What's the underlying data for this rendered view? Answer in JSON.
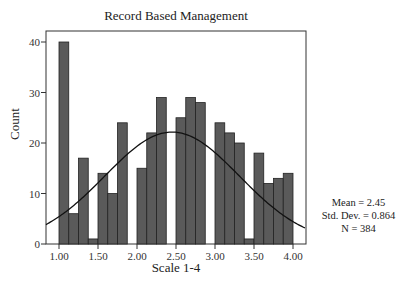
{
  "chart_data": {
    "type": "bar",
    "subtype": "histogram_with_normal_curve",
    "title": "Record Based Management",
    "xlabel": "Scale 1-4",
    "ylabel": "Count",
    "xlim": [
      0.833,
      4.167
    ],
    "ylim": [
      0,
      42
    ],
    "x_ticks": [
      "1.00",
      "1.50",
      "2.00",
      "2.50",
      "3.00",
      "3.50",
      "4.00"
    ],
    "x_tick_values": [
      1.0,
      1.5,
      2.0,
      2.5,
      3.0,
      3.5,
      4.0
    ],
    "y_ticks": [
      0,
      10,
      20,
      30,
      40
    ],
    "bin_width": 0.125,
    "bin_starts": [
      1.0,
      1.125,
      1.25,
      1.375,
      1.5,
      1.625,
      1.75,
      1.875,
      2.0,
      2.125,
      2.25,
      2.375,
      2.5,
      2.625,
      2.75,
      2.875,
      3.0,
      3.125,
      3.25,
      3.375,
      3.5,
      3.625,
      3.75,
      3.875
    ],
    "values": [
      40,
      6,
      17,
      1,
      14,
      10,
      24,
      0,
      15,
      22,
      29,
      0,
      25,
      29,
      28,
      0,
      24,
      22,
      20,
      1,
      18,
      12,
      13,
      14
    ],
    "normal_curve": {
      "mean": 2.45,
      "std_dev": 0.864,
      "n": 384
    },
    "grid": false,
    "legend": null,
    "bar_color": "#5a5a5a",
    "bar_edge_color": "#222222",
    "annotations": [
      "Mean = 2.45",
      "Std. Dev. = 0.864",
      "N = 384"
    ]
  },
  "labels": {
    "title": "Record Based Management",
    "xlabel": "Scale 1-4",
    "ylabel": "Count",
    "stats": {
      "mean": "Mean = 2.45",
      "std_dev": "Std. Dev. = 0.864",
      "n": "N = 384"
    }
  }
}
